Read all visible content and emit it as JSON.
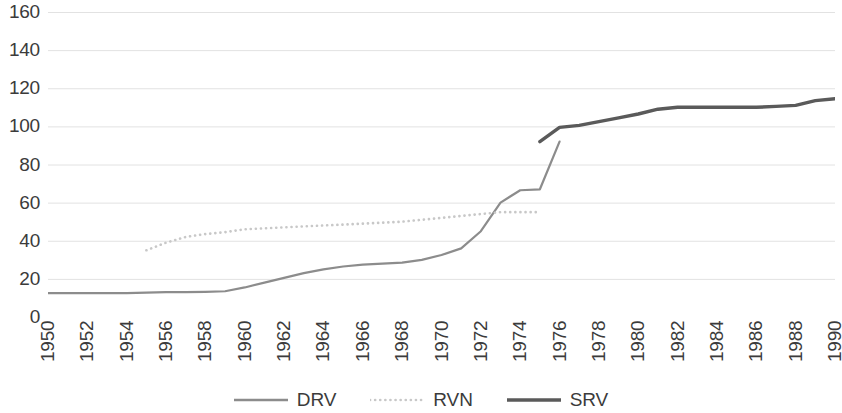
{
  "chart_data": {
    "type": "line",
    "title": "",
    "subtitle": "",
    "xlabel": "",
    "ylabel": "",
    "xlim": [
      1950,
      1990
    ],
    "ylim": [
      0,
      160
    ],
    "ytick_step": 20,
    "xtick_step": 2,
    "grid": "horizontal",
    "legend_position": "bottom",
    "y_ticks": [
      "160",
      "140",
      "120",
      "100",
      "80",
      "60",
      "40",
      "20",
      "0"
    ],
    "x_ticks": [
      "1950",
      "1952",
      "1954",
      "1956",
      "1958",
      "1960",
      "1962",
      "1964",
      "1966",
      "1968",
      "1970",
      "1972",
      "1974",
      "1976",
      "1978",
      "1980",
      "1982",
      "1984",
      "1986",
      "1988",
      "1990"
    ],
    "colors": {
      "drv": "#8c8c8c",
      "rvn": "#c8c8c8",
      "srv": "#5a5a5a",
      "gridline": "#e2e2e2",
      "text": "#3b3b3b"
    },
    "series": [
      {
        "name": "DRV",
        "style": "solid",
        "color": "#8c8c8c",
        "x": [
          1950,
          1951,
          1952,
          1953,
          1954,
          1955,
          1956,
          1957,
          1958,
          1959,
          1960,
          1961,
          1962,
          1963,
          1964,
          1965,
          1966,
          1967,
          1968,
          1969,
          1970,
          1971,
          1972,
          1973,
          1974,
          1975,
          1976
        ],
        "values": [
          12.5,
          12.5,
          12.5,
          12.5,
          12.5,
          12.8,
          13,
          13,
          13.2,
          13.5,
          15.5,
          18,
          20.5,
          23,
          25,
          26.5,
          27.5,
          28,
          28.5,
          30,
          32.5,
          36,
          45,
          60,
          66.5,
          67,
          92
        ]
      },
      {
        "name": "RVN",
        "style": "dotted",
        "color": "#c8c8c8",
        "x": [
          1955,
          1956,
          1957,
          1958,
          1959,
          1960,
          1961,
          1962,
          1963,
          1964,
          1965,
          1966,
          1967,
          1968,
          1969,
          1970,
          1971,
          1972,
          1973,
          1974,
          1975
        ],
        "values": [
          35,
          39,
          42,
          43.5,
          44.5,
          46,
          46.5,
          47,
          47.5,
          48,
          48.5,
          49,
          49.5,
          50,
          51,
          52,
          53,
          54,
          55,
          55,
          55
        ]
      },
      {
        "name": "SRV",
        "style": "solid-thick",
        "color": "#5a5a5a",
        "x": [
          1975,
          1976,
          1977,
          1978,
          1979,
          1980,
          1981,
          1982,
          1983,
          1984,
          1985,
          1986,
          1987,
          1988,
          1989,
          1990
        ],
        "values": [
          92,
          99.5,
          100.5,
          102.5,
          104.5,
          106.5,
          109,
          110,
          110,
          110,
          110,
          110,
          110.5,
          111,
          113.5,
          114.5
        ]
      }
    ],
    "legend": [
      {
        "label": "DRV",
        "style": "solid",
        "color": "#8c8c8c"
      },
      {
        "label": "RVN",
        "style": "dotted",
        "color": "#c8c8c8"
      },
      {
        "label": "SRV",
        "style": "solid-thick",
        "color": "#5a5a5a"
      }
    ]
  }
}
